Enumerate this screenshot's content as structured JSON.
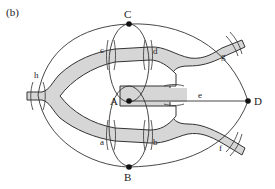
{
  "figure": {
    "panel_label": "(b)",
    "nodes": [
      {
        "id": "A",
        "label": "A"
      },
      {
        "id": "B",
        "label": "B"
      },
      {
        "id": "C",
        "label": "C"
      },
      {
        "id": "D",
        "label": "D"
      }
    ],
    "bridges": [
      {
        "id": "a",
        "label": "a",
        "connects": [
          "A",
          "B"
        ]
      },
      {
        "id": "b",
        "label": "b",
        "connects": [
          "A",
          "B"
        ]
      },
      {
        "id": "c",
        "label": "c",
        "connects": [
          "A",
          "C"
        ]
      },
      {
        "id": "d",
        "label": "d",
        "connects": [
          "A",
          "C"
        ]
      },
      {
        "id": "e",
        "label": "e",
        "connects": [
          "A",
          "D"
        ]
      },
      {
        "id": "f",
        "label": "f",
        "connects": [
          "B",
          "D"
        ]
      },
      {
        "id": "g",
        "label": "g",
        "connects": [
          "C",
          "D"
        ]
      },
      {
        "id": "h",
        "label": "h",
        "connects": [
          "B",
          "C"
        ]
      }
    ],
    "colors": {
      "river": "#d6d6d6",
      "lines": "#333333",
      "nodes": "#111111"
    }
  }
}
